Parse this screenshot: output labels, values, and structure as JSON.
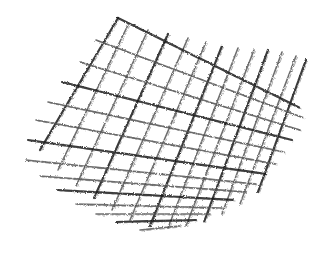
{
  "image": {
    "subject": "pencil crosshatch sketch",
    "background_color": "#ffffff",
    "stroke_color": "#1a1a1a",
    "light_stroke_color": "#555555",
    "width": 327,
    "height": 257
  },
  "lines": {
    "set_a": {
      "description": "steep lines running from upper-left down to lower-right",
      "count": 13,
      "start": [
        [
          118,
          18
        ],
        [
          128,
          25
        ],
        [
          148,
          30
        ],
        [
          168,
          34
        ],
        [
          188,
          38
        ],
        [
          206,
          42
        ],
        [
          222,
          46
        ],
        [
          238,
          48
        ],
        [
          254,
          50
        ],
        [
          268,
          50
        ],
        [
          282,
          52
        ],
        [
          296,
          56
        ],
        [
          306,
          60
        ]
      ],
      "end": [
        [
          40,
          150
        ],
        [
          58,
          170
        ],
        [
          76,
          186
        ],
        [
          94,
          198
        ],
        [
          112,
          210
        ],
        [
          130,
          220
        ],
        [
          150,
          226
        ],
        [
          168,
          228
        ],
        [
          186,
          226
        ],
        [
          204,
          222
        ],
        [
          222,
          214
        ],
        [
          240,
          204
        ],
        [
          258,
          192
        ]
      ]
    },
    "set_b": {
      "description": "lines running from upper-left across to lower-right at shallow angle",
      "count": 14,
      "start": [
        [
          118,
          18
        ],
        [
          96,
          40
        ],
        [
          80,
          62
        ],
        [
          62,
          82
        ],
        [
          48,
          102
        ],
        [
          36,
          120
        ],
        [
          28,
          140
        ],
        [
          26,
          160
        ],
        [
          40,
          176
        ],
        [
          58,
          190
        ],
        [
          76,
          204
        ],
        [
          96,
          214
        ],
        [
          116,
          222
        ],
        [
          140,
          230
        ]
      ],
      "end": [
        [
          300,
          108
        ],
        [
          304,
          118
        ],
        [
          300,
          130
        ],
        [
          292,
          140
        ],
        [
          284,
          152
        ],
        [
          276,
          164
        ],
        [
          266,
          174
        ],
        [
          256,
          184
        ],
        [
          246,
          192
        ],
        [
          234,
          200
        ],
        [
          222,
          208
        ],
        [
          210,
          214
        ],
        [
          196,
          220
        ],
        [
          180,
          226
        ]
      ]
    }
  }
}
